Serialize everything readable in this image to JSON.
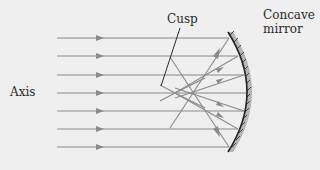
{
  "figure": {
    "labels": {
      "cusp": "Cusp",
      "mirror_line1": "Concave",
      "mirror_line2": "mirror",
      "axis": "Axis"
    },
    "colors": {
      "background": "#efefef",
      "ray": "#8a8a8a",
      "mirror": "#222222",
      "mirror_shade": "#b5b5b5",
      "text": "#2a2a2a"
    },
    "incident_ray_count": 7,
    "incident_ray_y": [
      38,
      56,
      75,
      93,
      111,
      129,
      147
    ]
  }
}
